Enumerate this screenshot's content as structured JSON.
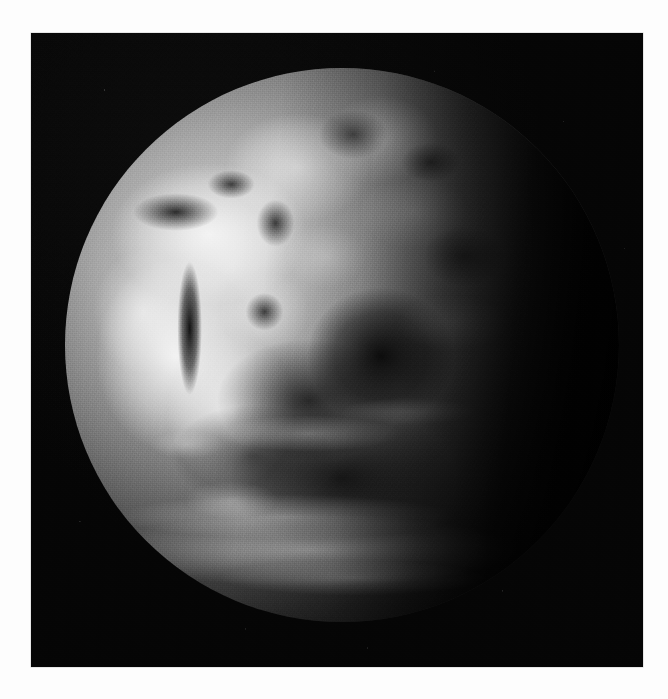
{
  "page": {
    "background_color": "#fdfdfd",
    "width": 668,
    "height": 699
  },
  "photo": {
    "kind": "satellite-photograph",
    "subject": "Earth",
    "color_mode": "grayscale",
    "frame_color": "#060606",
    "frame_rect": {
      "x": 31,
      "y": 33,
      "width": 612,
      "height": 634
    },
    "alt_text": "Black and white satellite photograph of the Earth seen from space, sunlit over Europe, Africa and the Arabian Peninsula, with the night-side terminator falling away to the right.",
    "caption": ""
  },
  "earth": {
    "label": "earth-disk",
    "center": {
      "x": 312,
      "y": 312
    },
    "radius": 277,
    "disk_rect": {
      "x": 65,
      "y": 68,
      "width": 554,
      "height": 554
    },
    "illumination": "sunlit on the left (west) limb, terminator fading to black toward the right",
    "bright_limb_side": "left",
    "terminator_x_range": [
      500,
      560
    ],
    "features": [
      {
        "name": "mediterranean-sea",
        "tone": "dark"
      },
      {
        "name": "black-sea",
        "tone": "dark"
      },
      {
        "name": "red-sea",
        "tone": "very-dark-streak"
      },
      {
        "name": "persian-gulf",
        "tone": "dark"
      },
      {
        "name": "arabian-peninsula",
        "tone": "bright"
      },
      {
        "name": "sahara-desert",
        "tone": "bright"
      },
      {
        "name": "african-cloud-mass",
        "tone": "very-bright"
      },
      {
        "name": "indian-ocean",
        "tone": "very-dark"
      },
      {
        "name": "southern-storm-band",
        "tone": "bright-arc"
      },
      {
        "name": "night-side-terminator",
        "tone": "black"
      }
    ],
    "tones": {
      "brightest": "#f6f6f6",
      "midtone": "#8a8a8a",
      "shadow": "#2a2a2a",
      "space": "#050505"
    }
  },
  "texture": {
    "film_grain": "heavy analog film grain across the whole print",
    "star_speckle": "sparse white emulsion speckles in the black space field"
  }
}
